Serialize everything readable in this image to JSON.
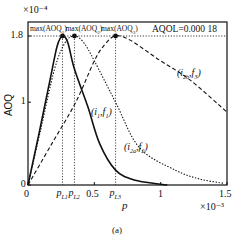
{
  "chart_data": {
    "type": "line",
    "title": "",
    "caption": "(a)",
    "xlabel": "p",
    "ylabel": "AOQ",
    "x_multiplier": "×10⁻³",
    "y_multiplier": "×10⁻⁴",
    "xlim": [
      0,
      1.5
    ],
    "ylim": [
      0,
      1.8
    ],
    "grid": false,
    "x_ticks": [
      {
        "value": 0,
        "label": "0"
      },
      {
        "value": 0.5,
        "label": "0.5"
      },
      {
        "value": 1,
        "label": "1"
      },
      {
        "value": 1.5,
        "label": "1.5"
      }
    ],
    "y_ticks": [
      {
        "value": 0,
        "label": "0"
      },
      {
        "value": 1,
        "label": "1"
      },
      {
        "value": 1.8,
        "label": "1.8"
      }
    ],
    "reference_line": {
      "y": 1.8,
      "label": "AQOL=0.000 18",
      "style": "dotted"
    },
    "markers": [
      {
        "name": "pL1",
        "label": "p",
        "sub": "L1",
        "x": 0.26,
        "y": 1.8,
        "top_label": "max(AOQ",
        "top_sub": "1",
        "top_suffix": ")"
      },
      {
        "name": "pL2",
        "label": "p",
        "sub": "L2",
        "x": 0.35,
        "y": 1.8,
        "top_label": "max(AOQ",
        "top_sub": "2",
        "top_suffix": ")"
      },
      {
        "name": "pL3",
        "label": "p",
        "sub": "L3",
        "x": 0.66,
        "y": 1.8,
        "top_label": "max(AOQ",
        "top_sub": "3",
        "top_suffix": ")"
      }
    ],
    "series": [
      {
        "name": "(i1,f1)",
        "label_main": "(i",
        "label_sub1": "1",
        "label_mid": ",f",
        "label_sub2": "1",
        "label_end": ")",
        "style": "solid",
        "x": [
          0,
          0.08,
          0.17,
          0.22,
          0.26,
          0.3,
          0.35,
          0.45,
          0.54,
          0.66,
          0.8,
          1.0,
          1.05
        ],
        "y": [
          0,
          0.6,
          1.3,
          1.68,
          1.8,
          1.72,
          1.4,
          0.95,
          0.5,
          0.18,
          0.06,
          0.01,
          0.0
        ]
      },
      {
        "name": "(i2a,f2)",
        "label_main": "(i",
        "label_sub1": "2a",
        "label_mid": ",f",
        "label_sub2": "2",
        "label_end": ")",
        "style": "dotted",
        "x": [
          0,
          0.1,
          0.2,
          0.28,
          0.35,
          0.42,
          0.5,
          0.66,
          0.84,
          1.11,
          1.3,
          1.48
        ],
        "y": [
          0,
          0.7,
          1.4,
          1.72,
          1.8,
          1.72,
          1.5,
          1.0,
          0.45,
          0.18,
          0.07,
          0.02
        ]
      },
      {
        "name": "(i2b,f3)",
        "label_main": "(i",
        "label_sub1": "2b",
        "label_mid": ",f",
        "label_sub2": "3",
        "label_end": ")",
        "style": "dashed",
        "x": [
          0,
          0.18,
          0.36,
          0.5,
          0.58,
          0.66,
          0.77,
          0.99,
          1.22,
          1.5
        ],
        "y": [
          0,
          0.5,
          1.0,
          1.5,
          1.7,
          1.8,
          1.75,
          1.51,
          1.27,
          0.88
        ]
      }
    ]
  }
}
